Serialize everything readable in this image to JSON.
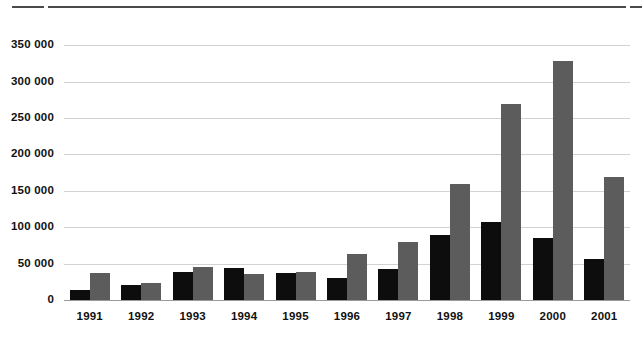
{
  "chart_data": {
    "type": "bar",
    "title": "",
    "subtitle": "",
    "xlabel": "",
    "ylabel": "",
    "categories": [
      "1991",
      "1992",
      "1993",
      "1994",
      "1995",
      "1996",
      "1997",
      "1998",
      "1999",
      "2000",
      "2001"
    ],
    "series": [
      {
        "name": "series-1-black",
        "color": "#0d0d0d",
        "values": [
          14000,
          20000,
          38000,
          44000,
          37000,
          30000,
          43000,
          89000,
          107000,
          85000,
          56000
        ]
      },
      {
        "name": "series-2-gray",
        "color": "#5c5c5c",
        "values": [
          37000,
          24000,
          45000,
          36000,
          39000,
          63000,
          80000,
          159000,
          269000,
          328000,
          169000
        ]
      }
    ],
    "ylim": [
      0,
      360000
    ],
    "yticks": [
      0,
      50000,
      100000,
      150000,
      200000,
      250000,
      300000,
      350000
    ],
    "ytick_labels": [
      "0",
      "50 000",
      "100 000",
      "150 000",
      "200 000",
      "250 000",
      "300 000",
      "350 000"
    ],
    "grid": true,
    "legend": "none",
    "annotations": []
  },
  "colors": {
    "series_1": "#0d0d0d",
    "series_2": "#5c5c5c",
    "gridline": "#d2d2d2",
    "axis": "#9a9a9a",
    "rule": "#4a4a4a",
    "background": "#ffffff",
    "text": "#111111"
  },
  "rules": {
    "top_left": "",
    "top_main": "",
    "top_right": ""
  }
}
